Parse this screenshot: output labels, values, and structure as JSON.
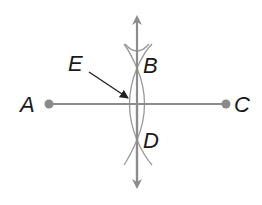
{
  "diagram": {
    "colors": {
      "line": "#8c8c8c",
      "arc": "#9a9a9a",
      "point": "#8a8a8a",
      "label": "#1a1a1a",
      "pointer": "#222222"
    },
    "points": {
      "A": {
        "label": "A",
        "x": 49,
        "y": 104
      },
      "C": {
        "label": "C",
        "x": 226,
        "y": 104
      },
      "B": {
        "label": "B",
        "x": 137,
        "y": 68
      },
      "D": {
        "label": "D",
        "x": 137,
        "y": 140
      },
      "E": {
        "label": "E",
        "x": 129,
        "y": 99
      }
    },
    "labels": {
      "A": "A",
      "B": "B",
      "C": "C",
      "D": "D",
      "E": "E"
    },
    "segments": [
      {
        "name": "segment-AC",
        "from": "A",
        "to": "C"
      }
    ],
    "lines": [
      {
        "name": "perpendicular-bisector-BD",
        "through": [
          "B",
          "D"
        ],
        "arrows": "both"
      }
    ]
  }
}
